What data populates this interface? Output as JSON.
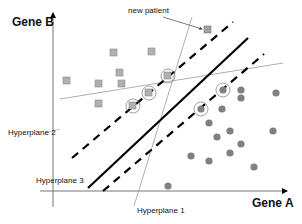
{
  "diagram": {
    "type": "svm-hyperplane-illustration",
    "axes": {
      "x_label": "Gene A",
      "y_label": "Gene B"
    },
    "annotations": {
      "new_patient": "new patient",
      "hyperplane_1": "Hyperplane 1",
      "hyperplane_2": "Hyperplane 2",
      "hyperplane_3": "Hyperplane 3"
    },
    "colors": {
      "square_fill": "#b0b0b0",
      "square_stroke": "#8a8a8a",
      "circle_fill": "#808080",
      "line": "#000000",
      "thin_line": "#9a9a9a"
    },
    "class_squares": [
      {
        "x": 114,
        "y": 53
      },
      {
        "x": 152,
        "y": 52
      },
      {
        "x": 120,
        "y": 73
      },
      {
        "x": 99,
        "y": 84
      },
      {
        "x": 122,
        "y": 84
      },
      {
        "x": 67,
        "y": 81
      },
      {
        "x": 99,
        "y": 104
      },
      {
        "x": 168,
        "y": 76,
        "support_vector": true
      },
      {
        "x": 149,
        "y": 93,
        "support_vector": true
      },
      {
        "x": 133,
        "y": 106,
        "support_vector": true
      }
    ],
    "new_patient_point": {
      "x": 208,
      "y": 30
    },
    "class_circles": [
      {
        "x": 223,
        "y": 90,
        "support_vector": true
      },
      {
        "x": 201,
        "y": 109,
        "support_vector": true
      },
      {
        "x": 241,
        "y": 90
      },
      {
        "x": 241,
        "y": 98
      },
      {
        "x": 276,
        "y": 93
      },
      {
        "x": 222,
        "y": 109
      },
      {
        "x": 209,
        "y": 123
      },
      {
        "x": 230,
        "y": 131
      },
      {
        "x": 217,
        "y": 137
      },
      {
        "x": 273,
        "y": 131
      },
      {
        "x": 241,
        "y": 144
      },
      {
        "x": 230,
        "y": 153
      },
      {
        "x": 191,
        "y": 156
      },
      {
        "x": 209,
        "y": 161
      },
      {
        "x": 254,
        "y": 167
      },
      {
        "x": 168,
        "y": 186
      }
    ]
  }
}
